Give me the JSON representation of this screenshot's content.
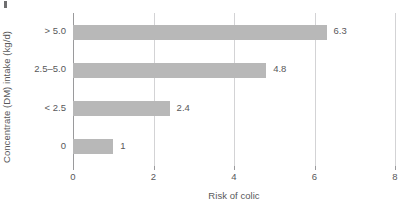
{
  "figure": {
    "artifact_mark": "crop-artifact"
  },
  "chart_data": {
    "type": "bar",
    "orientation": "horizontal",
    "title": "",
    "xlabel": "Risk of colic",
    "ylabel": "Concentrate (DM) intake (kg/d)",
    "categories": [
      "0",
      "< 2.5",
      "2.5–5.0",
      "> 5.0"
    ],
    "values": [
      1,
      2.4,
      4.8,
      6.3
    ],
    "value_labels": [
      "1",
      "2.4",
      "4.8",
      "6.3"
    ],
    "xlim": [
      0,
      8
    ],
    "xticks": [
      0,
      2,
      4,
      6,
      8
    ],
    "xtick_labels": [
      "0",
      "2",
      "4",
      "6",
      "8"
    ],
    "grid": "vertical-only",
    "legend": "none",
    "bar_color": "#b8b8b8",
    "axis_color": "#9a9a9c",
    "grid_color": "#d3d3d5",
    "text_color": "#58585a",
    "bars_top_to_bottom": [
      {
        "category": "> 5.0",
        "value": 6.3,
        "label": "6.3"
      },
      {
        "category": "2.5–5.0",
        "value": 4.8,
        "label": "4.8"
      },
      {
        "category": "< 2.5",
        "value": 2.4,
        "label": "2.4"
      },
      {
        "category": "0",
        "value": 1,
        "label": "1"
      }
    ]
  }
}
